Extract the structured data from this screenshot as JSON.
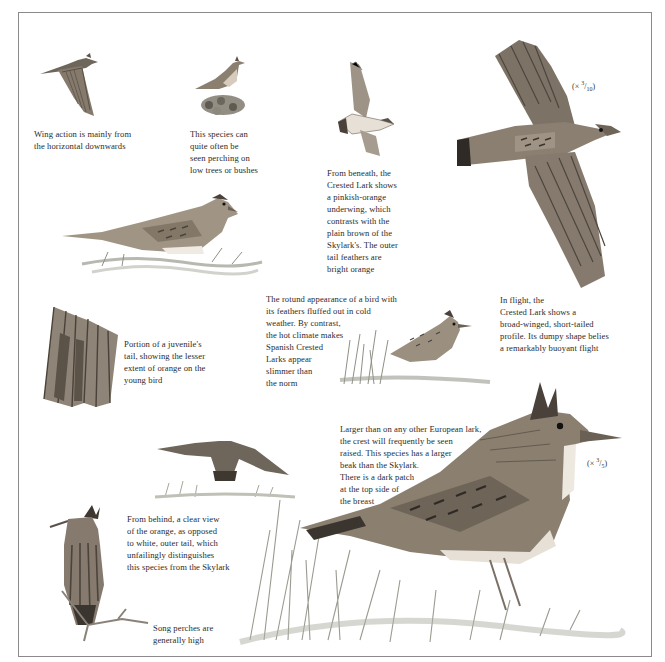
{
  "page": {
    "accent_colors": {
      "ink": "#2b2b2b",
      "feather_dark": "#4a4239",
      "feather_mid": "#8b7f70",
      "feather_light": "#c9bfb1",
      "grass": "#9a9a90"
    }
  },
  "captions": {
    "wing_action": [
      "Wing action is mainly from",
      "the horizontal downwards"
    ],
    "perching": [
      "This species can",
      "quite often be",
      "seen perching on",
      "low trees or bushes"
    ],
    "beneath": [
      "From beneath, the",
      "Crested Lark shows",
      "a pinkish-orange",
      "underwing, which",
      "contrasts with the",
      "plain brown of the",
      "Skylark's. The outer",
      "tail feathers are",
      "bright orange"
    ],
    "in_flight": [
      "In flight, the",
      "Crested Lark shows a",
      "broad-winged, short-tailed",
      "profile. Its dumpy shape belies",
      "a remarkably buoyant flight"
    ],
    "juvenile_tail": [
      "Portion of a juvenile's",
      "tail, showing the lesser",
      "extent of orange on the",
      "young bird"
    ],
    "rotund": [
      "The rotund appearance of a bird with",
      "its feathers fluffed out in cold",
      "weather. By contrast,",
      "the hot climate makes",
      "Spanish Crested",
      "Larks appear",
      "slimmer than",
      "the norm"
    ],
    "crest": [
      "Larger than on any other European lark,",
      "the crest will frequently be seen",
      "raised. This species has a larger",
      "beak than the Skylark.",
      "There is a dark patch",
      "at the top side of",
      "the breast"
    ],
    "behind": [
      "From behind, a clear view",
      "of the orange, as opposed",
      "to white, outer tail, which",
      "unfailingly distinguishes",
      "this species from the Skylark"
    ],
    "song_perch": [
      "Song perches are",
      "generally high"
    ]
  },
  "scales": {
    "flight_scale": {
      "prefix": "(× ",
      "num": "3",
      "den": "10",
      "suffix": ")"
    },
    "standing_scale": {
      "prefix": "(× ",
      "num": "3",
      "den": "5",
      "suffix": ")"
    }
  },
  "illustrations": [
    "flying-lark-side-icon",
    "lark-perched-on-bush-icon",
    "lark-underside-flight-icon",
    "lark-large-flight-above-icon",
    "lark-crouching-icon",
    "juvenile-tail-feathers-icon",
    "lark-fluffed-in-grass-icon",
    "lark-flying-away-icon",
    "lark-from-behind-on-branch-icon",
    "lark-standing-large-icon"
  ]
}
